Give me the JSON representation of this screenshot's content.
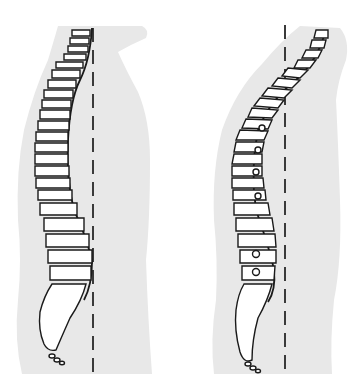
{
  "figure": {
    "panels": [
      {
        "id": "normal-posture",
        "position": "left",
        "plumb_line_x": 93,
        "posture": "upright"
      },
      {
        "id": "kyphotic-posture",
        "position": "right",
        "plumb_line_x": 285,
        "posture": "hunched"
      }
    ],
    "colors": {
      "background": "#ffffff",
      "body_silhouette": "#e8e8e8",
      "vertebra_fill": "#ffffff",
      "outline": "#1a1a1a",
      "plumb_line": "#3a3a3a"
    }
  }
}
